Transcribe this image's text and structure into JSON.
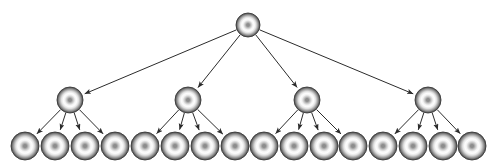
{
  "diagram": {
    "type": "tree",
    "canvas": {
      "width": 495,
      "height": 165,
      "background": "#ffffff"
    },
    "node_style": {
      "fill_outer": "#4f4f4f",
      "fill_ring": "#ffffff",
      "fill_center": "#8a8a8a",
      "stroke": "#3a3a3a",
      "shape": "sphere"
    },
    "edge_style": {
      "color": "#2b2b2b",
      "width": 1,
      "arrowhead": "solid-triangle",
      "directed": true
    },
    "levels": [
      {
        "name": "root-level",
        "depth": 0,
        "y": 25,
        "radius": 12,
        "node_count": 1,
        "nodes": [
          {
            "id": "root",
            "label": "",
            "cx": 248,
            "cy": 25,
            "r": 12
          }
        ]
      },
      {
        "name": "branch-level",
        "depth": 1,
        "y": 100,
        "radius": 13,
        "node_count": 4,
        "nodes": [
          {
            "id": "b1",
            "label": "",
            "cx": 70,
            "cy": 100,
            "r": 13
          },
          {
            "id": "b2",
            "label": "",
            "cx": 188,
            "cy": 100,
            "r": 13
          },
          {
            "id": "b3",
            "label": "",
            "cx": 307,
            "cy": 100,
            "r": 13
          },
          {
            "id": "b4",
            "label": "",
            "cx": 428,
            "cy": 100,
            "r": 13
          }
        ]
      },
      {
        "name": "leaf-level",
        "depth": 2,
        "y": 146,
        "radius": 14,
        "node_count": 16,
        "nodes": [
          {
            "id": "l1",
            "label": "",
            "cx": 25,
            "cy": 146,
            "r": 14
          },
          {
            "id": "l2",
            "label": "",
            "cx": 55,
            "cy": 146,
            "r": 14
          },
          {
            "id": "l3",
            "label": "",
            "cx": 85,
            "cy": 146,
            "r": 14
          },
          {
            "id": "l4",
            "label": "",
            "cx": 115,
            "cy": 146,
            "r": 14
          },
          {
            "id": "l5",
            "label": "",
            "cx": 145,
            "cy": 146,
            "r": 14
          },
          {
            "id": "l6",
            "label": "",
            "cx": 175,
            "cy": 146,
            "r": 14
          },
          {
            "id": "l7",
            "label": "",
            "cx": 205,
            "cy": 146,
            "r": 14
          },
          {
            "id": "l8",
            "label": "",
            "cx": 235,
            "cy": 146,
            "r": 14
          },
          {
            "id": "l9",
            "label": "",
            "cx": 264,
            "cy": 146,
            "r": 14
          },
          {
            "id": "l10",
            "label": "",
            "cx": 294,
            "cy": 146,
            "r": 14
          },
          {
            "id": "l11",
            "label": "",
            "cx": 324,
            "cy": 146,
            "r": 14
          },
          {
            "id": "l12",
            "label": "",
            "cx": 353,
            "cy": 146,
            "r": 14
          },
          {
            "id": "l13",
            "label": "",
            "cx": 383,
            "cy": 146,
            "r": 14
          },
          {
            "id": "l14",
            "label": "",
            "cx": 413,
            "cy": 146,
            "r": 14
          },
          {
            "id": "l15",
            "label": "",
            "cx": 443,
            "cy": 146,
            "r": 14
          },
          {
            "id": "l16",
            "label": "",
            "cx": 472,
            "cy": 146,
            "r": 14
          }
        ]
      }
    ],
    "edges": [
      {
        "from": "root",
        "to": "b1"
      },
      {
        "from": "root",
        "to": "b2"
      },
      {
        "from": "root",
        "to": "b3"
      },
      {
        "from": "root",
        "to": "b4"
      },
      {
        "from": "b1",
        "to": "l1"
      },
      {
        "from": "b1",
        "to": "l2"
      },
      {
        "from": "b1",
        "to": "l3"
      },
      {
        "from": "b1",
        "to": "l4"
      },
      {
        "from": "b2",
        "to": "l5"
      },
      {
        "from": "b2",
        "to": "l6"
      },
      {
        "from": "b2",
        "to": "l7"
      },
      {
        "from": "b2",
        "to": "l8"
      },
      {
        "from": "b3",
        "to": "l9"
      },
      {
        "from": "b3",
        "to": "l10"
      },
      {
        "from": "b3",
        "to": "l11"
      },
      {
        "from": "b3",
        "to": "l12"
      },
      {
        "from": "b4",
        "to": "l13"
      },
      {
        "from": "b4",
        "to": "l14"
      },
      {
        "from": "b4",
        "to": "l15"
      },
      {
        "from": "b4",
        "to": "l16"
      }
    ]
  }
}
